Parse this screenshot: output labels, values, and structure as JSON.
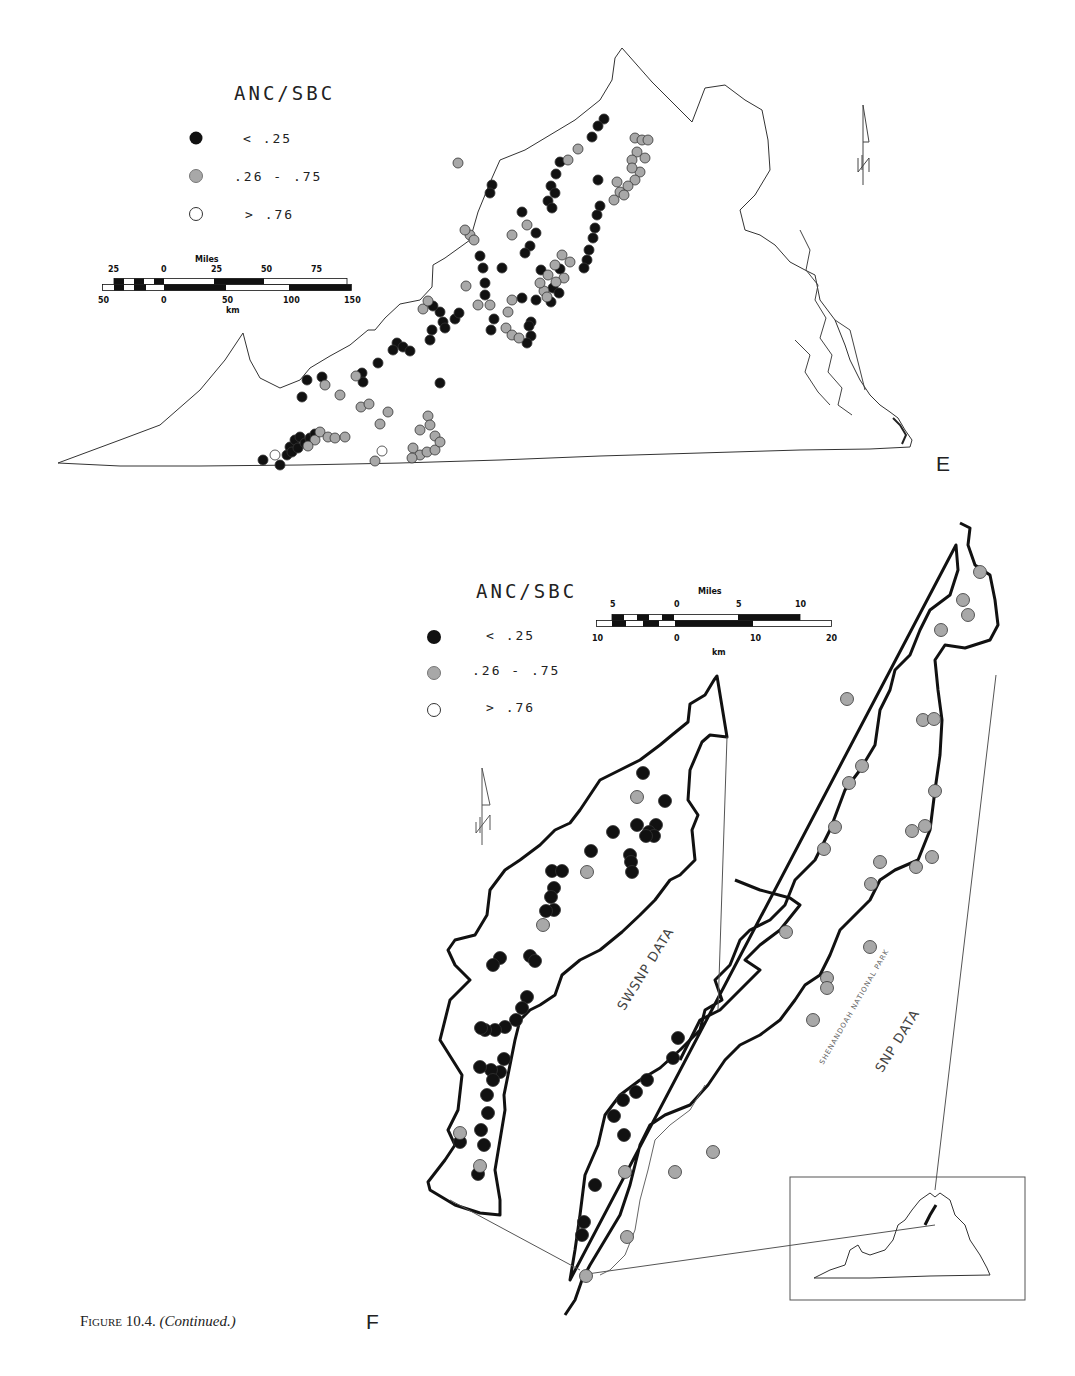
{
  "figure": {
    "caption_prefix": "Figure 10.4.",
    "caption_continued": "(Continued.)",
    "colors": {
      "low": "#111111",
      "mid": "#a8a8a8",
      "high": "#ffffff",
      "outline": "#111111",
      "state_line": "#555555"
    }
  },
  "panel_e": {
    "letter": "E",
    "legend": {
      "title": "ANC/SBC",
      "items": [
        {
          "symbol": "black-dot",
          "label": "< .25"
        },
        {
          "symbol": "gray-dot",
          "label": ".26 - .75"
        },
        {
          "symbol": "white-dot",
          "label": "> .76"
        }
      ]
    },
    "scale": {
      "miles_title": "Miles",
      "miles_ticks": [
        "25",
        "0",
        "25",
        "50",
        "75"
      ],
      "km_ticks": [
        "50",
        "0",
        "50",
        "100",
        "150"
      ],
      "km_title": "km"
    },
    "north_arrow": "north-arrow"
  },
  "panel_f": {
    "letter": "F",
    "legend": {
      "title": "ANC/SBC",
      "items": [
        {
          "symbol": "black-dot",
          "label": "< .25"
        },
        {
          "symbol": "gray-dot",
          "label": ".26 - .75"
        },
        {
          "symbol": "white-dot",
          "label": "> .76"
        }
      ]
    },
    "scale": {
      "miles_title": "Miles",
      "miles_ticks": [
        "5",
        "0",
        "5",
        "10"
      ],
      "km_ticks": [
        "10",
        "0",
        "10",
        "20"
      ],
      "km_title": "km"
    },
    "labels": {
      "swsnp": "SWSNP DATA",
      "snp": "SNP DATA",
      "park": "SHENANDOAH NATIONAL PARK"
    },
    "inset": "Virginia locator inset"
  }
}
